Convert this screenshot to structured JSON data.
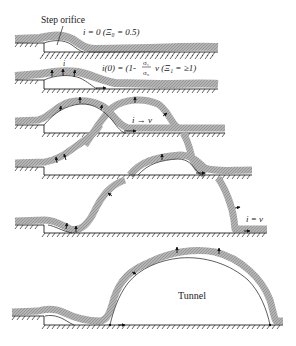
{
  "figure": {
    "type": "schematic",
    "colors": {
      "band": "#a8a8a8",
      "line": "#222222",
      "background": "#ffffff"
    }
  },
  "labels": {
    "step_orifice": "Step orifice",
    "panel1": "i = 0 (Ξ₀ = 0.5)",
    "panel2_prefix": "i(0) = (1-",
    "panel2_frac_num": "σ₁",
    "panel2_frac_den": "σ₀",
    "panel2_suffix": "v   (Ξ₁ = ≥1)",
    "panel2_i": "i",
    "panel3": "i → v",
    "panel5": "i = v",
    "panel6": "Tunnel"
  },
  "panels": [
    {
      "id": 1,
      "upper_y": 43,
      "lower_y": 52
    },
    {
      "id": 2,
      "upper_y": 80,
      "lower_y": 89
    },
    {
      "id": 3,
      "upper_y": 125,
      "lower_y": 133
    },
    {
      "id": 4,
      "upper_y": 167,
      "lower_y": 175
    },
    {
      "id": 5,
      "upper_y": 225,
      "lower_y": 233
    },
    {
      "id": 6,
      "upper_y": 316,
      "lower_y": 325
    }
  ]
}
